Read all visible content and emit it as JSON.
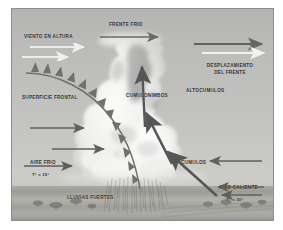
{
  "figure": {
    "background_color": "#b9b9b7",
    "frame_color": "#8e8e8c"
  },
  "labels": {
    "frente_frio": "FRENTE FRIO",
    "viento_en_altura": "VIENTO EN ALTURA",
    "desplazamiento_del_frente": "DESPLAZAMIENTO DEL FRENTE",
    "altocumulos": "ALTOCUMULOS",
    "cumulonimbos": "CUMULONIMBOS",
    "superficie_frontal": "SUPERFICIE FRONTAL",
    "cumulos": "CUMULOS",
    "aire_frio": "AIRE FRIO",
    "aire_frio_temp": "T° = 15°",
    "aire_caliente": "AIRE CALIENTE",
    "aire_caliente_temp": "T° = 30°",
    "lluvias_fuertes": "LLUVIAS FUERTES"
  },
  "icons": {
    "cold_front_surface": "cold-front-barb-curve",
    "updraft": "updraft-arrow",
    "cold_air_flow": "cold-air-arrow",
    "warm_air_flow": "warm-air-arrow",
    "upper_wind": "upper-level-wind-arrow",
    "front_motion": "front-motion-arrow",
    "rain": "rain-streaks",
    "tree": "tree-icon"
  },
  "colors": {
    "sky_top": "#b4b4b2",
    "sky_bottom": "#cfcfcb",
    "ground": "#a3a39d",
    "cloud_light": "#f2f2f0",
    "cloud_shadow": "#8d8d8a",
    "front_line": "#6f6f6d",
    "arrow_dark": "#5f5f5e",
    "arrow_light": "#f1f1ef",
    "text": "#2e2e2e"
  }
}
